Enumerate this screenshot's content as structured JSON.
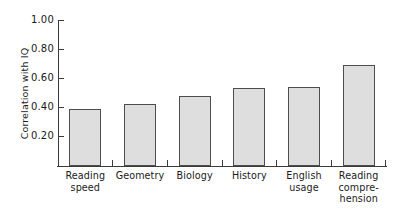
{
  "chart_data": {
    "type": "bar",
    "title": "",
    "xlabel": "",
    "ylabel": "Correlation with IQ",
    "categories": [
      "Reading speed",
      "Geometry",
      "Biology",
      "History",
      "English usage",
      "Reading comprehension"
    ],
    "category_label_lines": [
      [
        "Reading",
        "speed"
      ],
      [
        "Geometry"
      ],
      [
        "Biology"
      ],
      [
        "History"
      ],
      [
        "English",
        "usage"
      ],
      [
        "Reading",
        "compre-",
        "hension"
      ]
    ],
    "values": [
      0.42,
      0.46,
      0.52,
      0.58,
      0.585,
      0.75
    ],
    "ylim": [
      0.0,
      1.08
    ],
    "yticks": [
      0.2,
      0.4,
      0.6,
      0.8,
      1.0
    ],
    "ytick_labels": [
      "0.20",
      "0.40",
      "0.60",
      "0.80",
      "1.00"
    ],
    "grid": false,
    "legend": null,
    "bar_fill_color": "#dedede",
    "bar_edge_color": "#4d4d4d",
    "axis_color": "#3a3a3a",
    "background_color": "#ffffff"
  }
}
